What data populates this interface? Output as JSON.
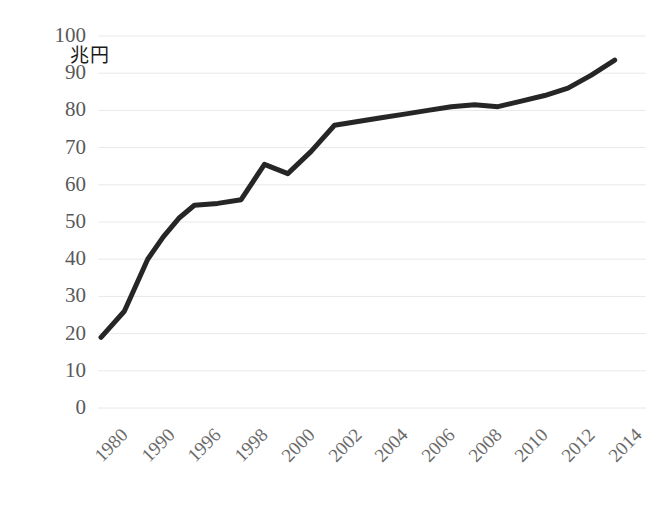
{
  "chart": {
    "type": "line",
    "y_axis_title": "兆円",
    "background_color": "#ffffff",
    "line_color": "#262626",
    "gridline_color": "#e8e8e8",
    "tick_label_color": "#595959"
  },
  "chart_data": {
    "type": "line",
    "title": "",
    "subtitle": "",
    "xlabel": "",
    "ylabel": "兆円",
    "ylim": [
      0,
      100
    ],
    "ytick_step": 10,
    "yticks": [
      "100",
      "90",
      "80",
      "70",
      "60",
      "50",
      "40",
      "30",
      "20",
      "10",
      "0"
    ],
    "categories": [
      "1980",
      "1990",
      "1996",
      "1998",
      "2000",
      "2002",
      "2004",
      "2006",
      "2008",
      "2010",
      "2012",
      "2014"
    ],
    "xtick_labels": [
      "1980",
      "1990",
      "1996",
      "1998",
      "2000",
      "2002",
      "2004",
      "2006",
      "2008",
      "2010",
      "2012",
      "2014"
    ],
    "xtick_rotation_deg": -45,
    "grid": "horizontal",
    "legend": "none",
    "markers": "none",
    "series": [
      {
        "name": "兆円",
        "x": [
          "1980",
          "1985",
          "1990",
          "1992",
          "1994",
          "1996",
          "1997",
          "1998",
          "1999",
          "2000",
          "2001",
          "2002",
          "2003",
          "2004",
          "2005",
          "2006",
          "2007",
          "2008",
          "2009",
          "2010",
          "2011",
          "2012",
          "2013",
          "2014"
        ],
        "values": [
          19,
          26,
          40,
          46,
          51,
          54.5,
          55,
          56,
          65.5,
          63,
          69,
          76,
          77,
          78,
          79,
          80,
          81,
          81.5,
          81,
          82.5,
          84,
          86,
          89.5,
          93.5
        ]
      }
    ]
  }
}
